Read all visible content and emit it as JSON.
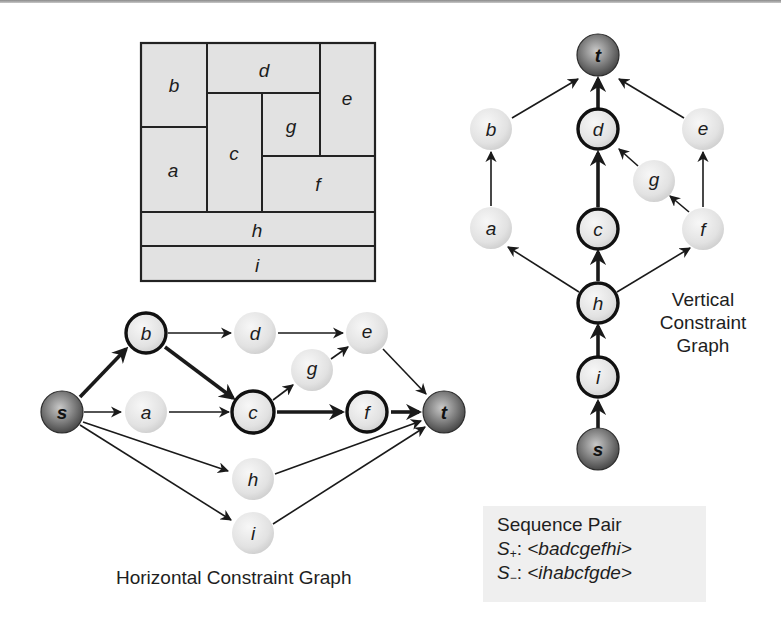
{
  "colors": {
    "block_fill": "#e2e2e2",
    "block_stroke": "#222222",
    "node_fill_light": "#e6e6e6",
    "node_fill_terminal": "#6f6f6f",
    "edge": "#1a1a1a",
    "seq_box_bg": "#efefef"
  },
  "floorplan": {
    "blocks": [
      {
        "id": "b",
        "label": "b"
      },
      {
        "id": "d",
        "label": "d"
      },
      {
        "id": "e",
        "label": "e"
      },
      {
        "id": "a",
        "label": "a"
      },
      {
        "id": "c",
        "label": "c"
      },
      {
        "id": "g",
        "label": "g"
      },
      {
        "id": "f",
        "label": "f"
      },
      {
        "id": "h",
        "label": "h"
      },
      {
        "id": "i",
        "label": "i"
      }
    ]
  },
  "horizontal_graph": {
    "caption": "Horizontal Constraint Graph",
    "nodes": {
      "s": "s",
      "b": "b",
      "a": "a",
      "d": "d",
      "e": "e",
      "g": "g",
      "c": "c",
      "f": "f",
      "t": "t",
      "h": "h",
      "i": "i"
    },
    "critical_path": [
      "s",
      "b",
      "c",
      "f",
      "t"
    ],
    "edges": [
      [
        "s",
        "b"
      ],
      [
        "s",
        "a"
      ],
      [
        "s",
        "h"
      ],
      [
        "s",
        "i"
      ],
      [
        "b",
        "d"
      ],
      [
        "b",
        "c"
      ],
      [
        "a",
        "c"
      ],
      [
        "d",
        "e"
      ],
      [
        "c",
        "g"
      ],
      [
        "g",
        "e"
      ],
      [
        "c",
        "f"
      ],
      [
        "e",
        "t"
      ],
      [
        "f",
        "t"
      ],
      [
        "h",
        "t"
      ],
      [
        "i",
        "t"
      ]
    ]
  },
  "vertical_graph": {
    "caption_lines": [
      "Vertical",
      "Constraint",
      "Graph"
    ],
    "nodes": {
      "t": "t",
      "b": "b",
      "d": "d",
      "e": "e",
      "g": "g",
      "a": "a",
      "c": "c",
      "f": "f",
      "h": "h",
      "i": "i",
      "s": "s"
    },
    "critical_path": [
      "s",
      "i",
      "h",
      "c",
      "d",
      "t"
    ],
    "edges": [
      [
        "s",
        "i"
      ],
      [
        "i",
        "h"
      ],
      [
        "h",
        "a"
      ],
      [
        "h",
        "c"
      ],
      [
        "h",
        "f"
      ],
      [
        "a",
        "b"
      ],
      [
        "c",
        "d"
      ],
      [
        "f",
        "g"
      ],
      [
        "f",
        "e"
      ],
      [
        "g",
        "d"
      ],
      [
        "b",
        "t"
      ],
      [
        "d",
        "t"
      ],
      [
        "e",
        "t"
      ]
    ]
  },
  "sequence_pair": {
    "title": "Sequence Pair",
    "s_plus": {
      "symbol": "S",
      "sub": "+",
      "sep": ": ",
      "value": "<badcgefhi>"
    },
    "s_minus": {
      "symbol": "S",
      "sub": "−",
      "sep": ": ",
      "value": "<ihabcfgde>"
    }
  }
}
